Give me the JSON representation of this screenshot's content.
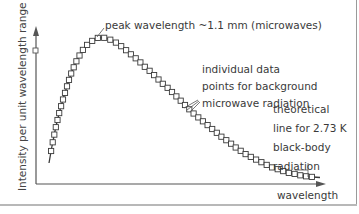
{
  "chart_data": {
    "type": "line",
    "title": "",
    "xlabel": "wavelength",
    "ylabel": "Intensity per unit wavelength range",
    "grid": false,
    "legend": null,
    "series": [
      {
        "name": "individual data points for background microwave radiation",
        "style": "open-square markers",
        "x": [
          0.1,
          0.15,
          0.2,
          0.25,
          0.3,
          0.35,
          0.4,
          0.45,
          0.5,
          0.55,
          0.6,
          0.7,
          0.8,
          0.9,
          1.0,
          1.1,
          1.2,
          1.3,
          1.4,
          1.5,
          1.6,
          1.7,
          1.8,
          1.9,
          2.0,
          2.1,
          2.2,
          2.3,
          2.4,
          2.5,
          2.6,
          2.7,
          2.8,
          2.9,
          3.0,
          3.1,
          3.2,
          3.3,
          3.4,
          3.5,
          3.6,
          3.7,
          3.8,
          3.9,
          4.0,
          4.2,
          4.4,
          4.6,
          4.8,
          5.0,
          5.2,
          5.4,
          5.6,
          5.8,
          6.0,
          6.2,
          6.4,
          6.6,
          6.8,
          7.0,
          7.2,
          7.4
        ],
        "y_relative": [
          0.2,
          0.45,
          0.58,
          0.67,
          0.75,
          0.81,
          0.86,
          0.9,
          0.93,
          0.96,
          0.98,
          0.995,
          1.0,
          0.995,
          0.98,
          0.955,
          0.93,
          0.9,
          0.87,
          0.84,
          0.805,
          0.77,
          0.735,
          0.7,
          0.665,
          0.63,
          0.6,
          0.565,
          0.535,
          0.505,
          0.475,
          0.45,
          0.42,
          0.395,
          0.37,
          0.35,
          0.325,
          0.305,
          0.285,
          0.265,
          0.25,
          0.23,
          0.215,
          0.2,
          0.185,
          0.16,
          0.14,
          0.12,
          0.105,
          0.09,
          0.078,
          0.068,
          0.058,
          0.05,
          0.043,
          0.037,
          0.032,
          0.028,
          0.024,
          0.021,
          0.018,
          0.016
        ]
      },
      {
        "name": "theoretical line for 2.73 K black-body radiation",
        "style": "solid line"
      }
    ],
    "annotations": [
      "peak wavelength ~1.1 mm (microwaves)",
      "individual data points for background microwave radiation",
      "theoretical line for 2.73 K black-body radiation"
    ]
  },
  "labels": {
    "ylabel": "Intensity per unit wavelength range",
    "xlabel": "wavelength",
    "peak": "peak wavelength ~1.1 mm (microwaves)",
    "data_points": [
      "individual data",
      "points for background",
      "microwave radiation"
    ],
    "theory": [
      "theoretical",
      "line for 2.73 K",
      "black-body",
      "radiation"
    ]
  },
  "colors": {
    "ink": "#3a3a3a",
    "axis": "#555555",
    "frame": "#9a9a9a"
  }
}
